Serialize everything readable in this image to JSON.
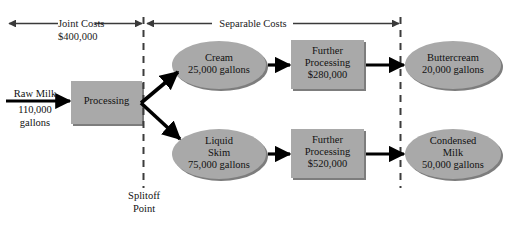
{
  "diagram": {
    "title_hidden": "",
    "colors": {
      "shape_fill": "#a9a9a9",
      "shape_shadow": "#7d7d7d",
      "line": "#000000",
      "dashed_line": "#3c3c3c",
      "header_arrow": "#3a3a3a",
      "background": "#ffffff",
      "text": "#111111"
    }
  },
  "header": {
    "joint_costs": {
      "label": "Joint Costs",
      "amount": "$400,000"
    },
    "separable_costs": {
      "label": "Separable Costs"
    }
  },
  "splitoff": {
    "line1": "Splitoff",
    "line2": "Point"
  },
  "input": {
    "line1": "Raw Milk",
    "line2": "110,000",
    "line3": "gallons"
  },
  "nodes": {
    "processing": {
      "line1": "Processing"
    },
    "cream": {
      "line1": "Cream",
      "line2": "25,000 gallons"
    },
    "liquid_skim": {
      "line1": "Liquid",
      "line2": "Skim",
      "line3": "75,000 gallons"
    },
    "further_processing_top": {
      "line1": "Further",
      "line2": "Processing",
      "line3": "$280,000"
    },
    "further_processing_bottom": {
      "line1": "Further",
      "line2": "Processing",
      "line3": "$520,000"
    },
    "buttercream": {
      "line1": "Buttercream",
      "line2": "20,000 gallons"
    },
    "condensed_milk": {
      "line1": "Condensed",
      "line2": "Milk",
      "line3": "50,000 gallons"
    }
  }
}
